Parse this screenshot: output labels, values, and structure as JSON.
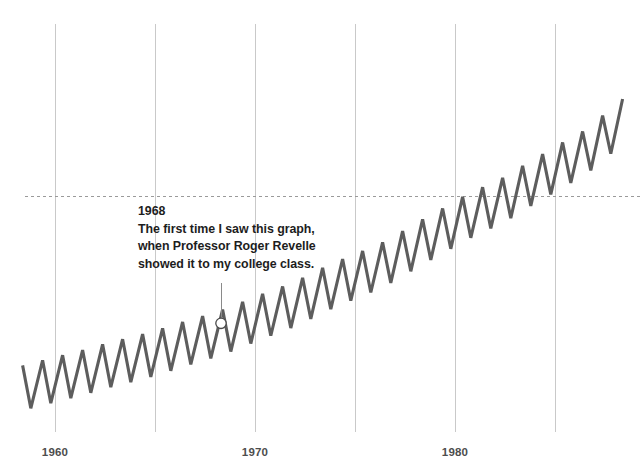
{
  "chart_data": {
    "type": "line",
    "title": "",
    "subtitle": "",
    "xlabel": "",
    "ylabel": "",
    "xlim": [
      1958.0,
      1987.4
    ],
    "ylim": [
      310,
      352
    ],
    "grid": true,
    "grid_axis": "x",
    "legend": "none",
    "series_name": "Atmospheric CO2 concentration (Keeling curve)",
    "series_color": "#5d5d5d",
    "series_line_width": 3.1,
    "x_ticks": [
      1960,
      1970,
      1980
    ],
    "x_tick_labels": [
      "1960",
      "1970",
      "1980"
    ],
    "gridline_years": [
      1960,
      1965,
      1970,
      1975,
      1980,
      1985
    ],
    "threshold_line": {
      "value": 341.5,
      "style": "dashed",
      "color": "#9a9a9a",
      "label": ""
    },
    "seasonal_amplitude": 3.1,
    "points_per_year": 12,
    "annual_trend": [
      {
        "year": 1958.5,
        "value": 315.2
      },
      {
        "year": 1959.5,
        "value": 315.9
      },
      {
        "year": 1960.5,
        "value": 316.6
      },
      {
        "year": 1961.5,
        "value": 317.3
      },
      {
        "year": 1962.5,
        "value": 318.1
      },
      {
        "year": 1963.5,
        "value": 318.8
      },
      {
        "year": 1964.5,
        "value": 319.5
      },
      {
        "year": 1965.5,
        "value": 320.3
      },
      {
        "year": 1966.5,
        "value": 321.2
      },
      {
        "year": 1967.5,
        "value": 322.0
      },
      {
        "year": 1968.5,
        "value": 322.9
      },
      {
        "year": 1969.5,
        "value": 324.0
      },
      {
        "year": 1970.5,
        "value": 325.1
      },
      {
        "year": 1971.5,
        "value": 326.1
      },
      {
        "year": 1972.5,
        "value": 327.3
      },
      {
        "year": 1973.5,
        "value": 328.7
      },
      {
        "year": 1974.5,
        "value": 329.9
      },
      {
        "year": 1975.5,
        "value": 331.0
      },
      {
        "year": 1976.5,
        "value": 332.2
      },
      {
        "year": 1977.5,
        "value": 333.8
      },
      {
        "year": 1978.5,
        "value": 335.4
      },
      {
        "year": 1979.5,
        "value": 336.9
      },
      {
        "year": 1980.5,
        "value": 338.5
      },
      {
        "year": 1981.5,
        "value": 339.8
      },
      {
        "year": 1982.5,
        "value": 341.1
      },
      {
        "year": 1983.5,
        "value": 342.8
      },
      {
        "year": 1984.5,
        "value": 344.4
      },
      {
        "year": 1985.5,
        "value": 346.0
      },
      {
        "year": 1986.5,
        "value": 347.5
      },
      {
        "year": 1987.2,
        "value": 349.1
      }
    ]
  },
  "annotation": {
    "year": "1968",
    "lines": [
      "The first time I saw this graph,",
      "when Professor Roger Revelle",
      "showed it to my college class."
    ],
    "marker_year": 1968.3,
    "marker_value": 324.0,
    "text_color": "#1d1d1d",
    "leader_color": "#8a8a8a"
  },
  "axis": {
    "tick_label_color": "#4d4d4d",
    "gridline_color": "#c9c9c9"
  }
}
